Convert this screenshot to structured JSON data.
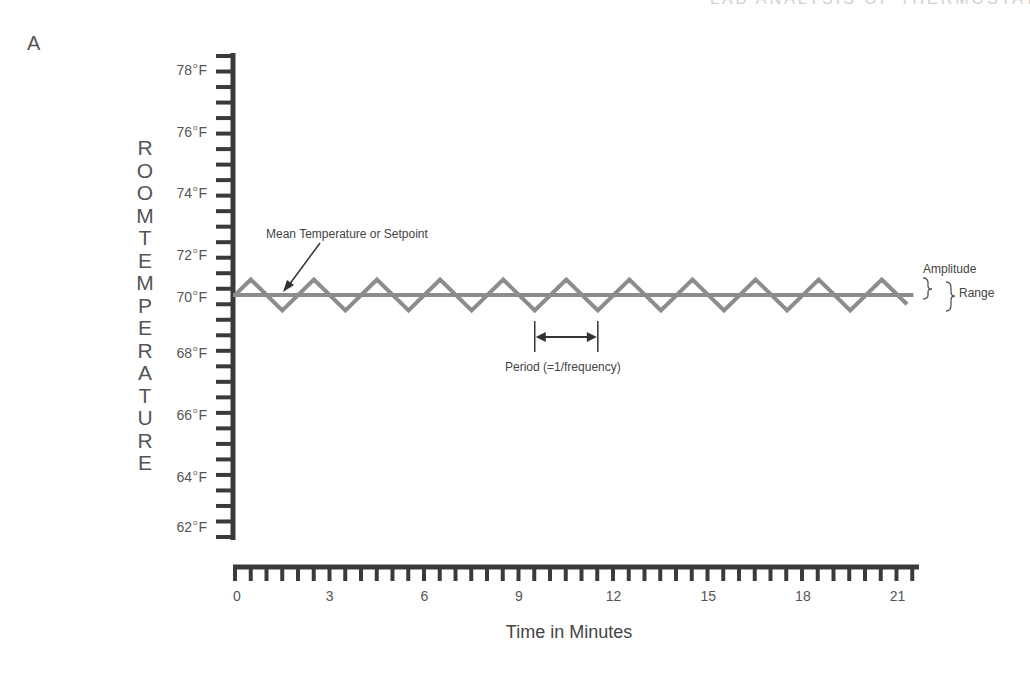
{
  "figure": {
    "panel_label": "A",
    "top_cropped_text": "LAB ANALYSIS OF THERMOSTAT"
  },
  "chart_data": {
    "type": "line",
    "title": "",
    "xlabel": "Time in Minutes",
    "ylabel": "ROOM TEMPERATURE",
    "ylabel_letters": [
      "R",
      "O",
      "O",
      "M",
      "T",
      "E",
      "M",
      "P",
      "E",
      "R",
      "A",
      "T",
      "U",
      "R",
      "E"
    ],
    "x_ticks": [
      0,
      3,
      6,
      9,
      12,
      15,
      18,
      21
    ],
    "x_tick_labels": [
      "0",
      "3",
      "6",
      "9",
      "12",
      "15",
      "18",
      "21"
    ],
    "y_ticks": [
      78,
      76,
      74,
      72,
      70,
      68,
      66,
      64,
      62
    ],
    "y_tick_labels": [
      "78",
      "76",
      "74",
      "72",
      "70",
      "68",
      "66",
      "64",
      "62"
    ],
    "y_unit": "°F",
    "xlim": [
      0,
      21.5
    ],
    "ylim": [
      61,
      79
    ],
    "grid": false,
    "legend": null,
    "series": [
      {
        "name": "Mean Temperature or Setpoint",
        "style": "flat line",
        "color": "#8a8a8a",
        "x": [
          0,
          21.5
        ],
        "y": [
          70,
          70
        ]
      },
      {
        "name": "Room Temperature (oscillation)",
        "style": "triangle wave",
        "color": "#8a8a8a",
        "mean": 70,
        "amplitude": 0.5,
        "period_minutes": 2,
        "x": [
          0,
          0.5,
          1.5,
          2.5,
          3.5,
          4.5,
          5.5,
          6.5,
          7.5,
          8.5,
          9.5,
          10.5,
          11.5,
          12.5,
          13.5,
          14.5,
          15.5,
          16.5,
          17.5,
          18.5,
          19.5,
          20.5,
          21.3
        ],
        "y": [
          70,
          70.5,
          69.5,
          70.5,
          69.5,
          70.5,
          69.5,
          70.5,
          69.5,
          70.5,
          69.5,
          70.5,
          69.5,
          70.5,
          69.5,
          70.5,
          69.5,
          70.5,
          69.5,
          70.5,
          69.5,
          70.5,
          69.7
        ]
      }
    ],
    "annotations": [
      {
        "text": "Mean Temperature or Setpoint",
        "type": "arrow",
        "points_to": "mean line near x=1.5"
      },
      {
        "text": "Period (=1/frequency)",
        "type": "double-arrow",
        "from_x": 9.5,
        "to_x": 11.5
      },
      {
        "text": "Amplitude",
        "type": "brace",
        "span": "mean to peak"
      },
      {
        "text": "Range",
        "type": "brace",
        "span": "trough to peak"
      }
    ]
  },
  "annotations": {
    "mean_label": "Mean Temperature or Setpoint",
    "period_label": "Period (=1/frequency)",
    "amplitude_label": "Amplitude",
    "range_label": "Range"
  },
  "colors": {
    "axis": "#3a3a3a",
    "wave": "#8c8c8c",
    "text": "#555555"
  }
}
